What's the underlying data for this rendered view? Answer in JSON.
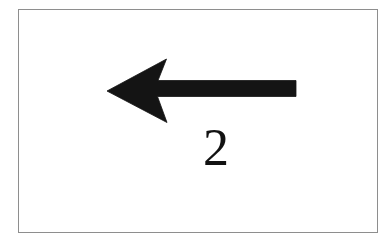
{
  "figure": {
    "kind": "arrow-diagram",
    "background_color": "#ffffff",
    "frame": {
      "visible": true,
      "stroke_color": "#5a5a5a",
      "stroke_width_px": 1.4,
      "x": 18,
      "y": 9,
      "width": 360,
      "height": 224
    },
    "label": {
      "text": "2",
      "color": "#121212",
      "font_size_px": 52,
      "style": "serif",
      "x": 198,
      "y": 128
    },
    "arrow": {
      "name": "left-arrow",
      "direction": "left",
      "fill_color": "#141414",
      "tip_x": 107,
      "tip_y": 91,
      "shaft_start_x": 165,
      "shaft_end_x": 296,
      "shaft_top_y": 82,
      "shaft_bottom_y": 96,
      "head_top_barb_x": 167,
      "head_top_barb_y": 59,
      "head_bottom_barb_x": 167,
      "head_bottom_barb_y": 122,
      "head_notch_x": 152,
      "head_style": "barbed-concave",
      "path": "M 107.0 91.0 L 166.5 59.0 L 158.0 80.5 L 296.0 80.5 L 296.0 96.5 L 157.5 96.5 L 167.0 122.5 Z"
    }
  },
  "chart_data": {
    "type": "diagram",
    "title": "",
    "elements": [
      {
        "name": "left-arrow",
        "shape": "arrow",
        "direction": "left",
        "label": "2",
        "color": "#141414"
      }
    ],
    "annotations": [
      "2"
    ],
    "legend": [],
    "xlabel": "",
    "ylabel": ""
  }
}
